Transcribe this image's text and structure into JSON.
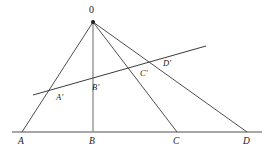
{
  "figure": {
    "type": "geometry-diagram",
    "background_color": "#ffffff",
    "stroke_color": "#3a3a3a",
    "baseline_color": "#8a8a8a",
    "vertical_color": "#8a8a8a",
    "apex": {
      "name": "O",
      "label": "0",
      "x": 93,
      "y": 22,
      "label_x": 89,
      "label_y": 7
    },
    "baseline": {
      "name": "baseline-ABCD",
      "x1": 12,
      "y1": 132,
      "x2": 262,
      "y2": 132
    },
    "transversal": {
      "name": "transversal-A'B'C'D'",
      "x1": 33,
      "y1": 95,
      "x2": 206,
      "y2": 46
    },
    "base_points": [
      {
        "label": "A",
        "x": 22,
        "y": 132,
        "label_x": 18,
        "label_y": 137
      },
      {
        "label": "B",
        "x": 93,
        "y": 132,
        "label_x": 89,
        "label_y": 137
      },
      {
        "label": "C",
        "x": 177,
        "y": 132,
        "label_x": 173,
        "label_y": 137
      },
      {
        "label": "D",
        "x": 247,
        "y": 132,
        "label_x": 243,
        "label_y": 137
      }
    ],
    "transversal_points": [
      {
        "label": "A'",
        "x": 55,
        "y": 92,
        "label_x": 56,
        "label_y": 93
      },
      {
        "label": "B'",
        "x": 93,
        "y": 81,
        "label_x": 92,
        "label_y": 83
      },
      {
        "label": "C'",
        "x": 139,
        "y": 68,
        "label_x": 140,
        "label_y": 69
      },
      {
        "label": "D'",
        "x": 152,
        "y": 64,
        "label_x": 163,
        "label_y": 59
      }
    ],
    "rays": [
      {
        "name": "ray-OA",
        "x1": 93,
        "y1": 22,
        "x2": 22,
        "y2": 132
      },
      {
        "name": "ray-OB",
        "x1": 93,
        "y1": 22,
        "x2": 93,
        "y2": 132
      },
      {
        "name": "ray-OC",
        "x1": 93,
        "y1": 22,
        "x2": 177,
        "y2": 132
      },
      {
        "name": "ray-OD",
        "x1": 93,
        "y1": 22,
        "x2": 247,
        "y2": 132
      }
    ]
  }
}
